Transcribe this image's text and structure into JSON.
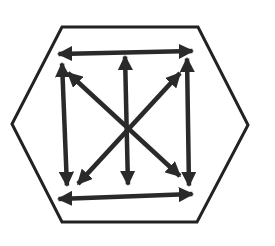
{
  "diagram": {
    "title": "",
    "colors": {
      "background": "#ffffff",
      "hexagon_stroke": "#222222",
      "arrow": "#2a2a2a"
    },
    "hexagon": {
      "points": [
        [
          62,
          27
        ],
        [
          198,
          27
        ],
        [
          248,
          125
        ],
        [
          197,
          222
        ],
        [
          62,
          222
        ],
        [
          12,
          124
        ]
      ],
      "stroke_width": 3
    },
    "arrows": [
      {
        "id": "top-horizontal",
        "from": [
          57,
          54
        ],
        "to": [
          194,
          51
        ],
        "double_headed": true
      },
      {
        "id": "bottom-horizontal",
        "from": [
          57,
          199
        ],
        "to": [
          194,
          194
        ],
        "double_headed": true
      },
      {
        "id": "left-vertical",
        "from": [
          62,
          62
        ],
        "to": [
          67,
          187
        ],
        "double_headed": true
      },
      {
        "id": "right-vertical",
        "from": [
          187,
          57
        ],
        "to": [
          189,
          187
        ],
        "double_headed": true
      },
      {
        "id": "center-vertical",
        "from": [
          125,
          55
        ],
        "to": [
          128,
          186
        ],
        "double_headed": true
      },
      {
        "id": "diagonal-tl-br",
        "from": [
          67,
          72
        ],
        "to": [
          181,
          177
        ],
        "double_headed": true
      },
      {
        "id": "diagonal-tr-bl",
        "from": [
          181,
          72
        ],
        "to": [
          77,
          185
        ],
        "double_headed": true
      }
    ]
  }
}
